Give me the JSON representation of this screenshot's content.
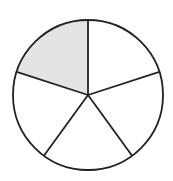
{
  "diagram": {
    "type": "fraction-circle",
    "total_parts": 5,
    "shaded_parts": 1,
    "fraction_label": "1/5",
    "center": [
      88,
      95
    ],
    "radius": 75,
    "stroke_color": "#222222",
    "shade_color": "#e4e4e4",
    "fill_color": "#ffffff",
    "sectors": [
      {
        "index": 0,
        "start_deg": 90,
        "end_deg": 162,
        "shaded": true
      },
      {
        "index": 1,
        "start_deg": 18,
        "end_deg": 90,
        "shaded": false
      },
      {
        "index": 2,
        "start_deg": -54,
        "end_deg": 18,
        "shaded": false
      },
      {
        "index": 3,
        "start_deg": -126,
        "end_deg": -54,
        "shaded": false
      },
      {
        "index": 4,
        "start_deg": 162,
        "end_deg": 234,
        "shaded": false
      }
    ]
  }
}
